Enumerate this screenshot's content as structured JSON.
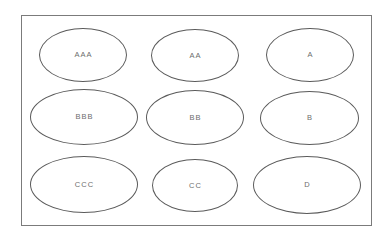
{
  "diagram": {
    "type": "ellipse-grid",
    "frame": {
      "border_color": "#7b7b7b",
      "background": "#ffffff"
    },
    "style": {
      "ellipse_stroke": "#5b5b5b",
      "ellipse_fill": "#ffffff",
      "label_color": "#6e6e6e"
    },
    "rows": [
      {
        "row_index": 1,
        "nodes": [
          {
            "label": "AAA",
            "left": 17,
            "top": 12,
            "width": 88,
            "height": 54
          },
          {
            "label": "AA",
            "left": 129,
            "top": 13,
            "width": 88,
            "height": 53
          },
          {
            "label": "A",
            "left": 244,
            "top": 12,
            "width": 88,
            "height": 54
          }
        ]
      },
      {
        "row_index": 2,
        "nodes": [
          {
            "label": "BBB",
            "left": 8,
            "top": 73,
            "width": 108,
            "height": 56
          },
          {
            "label": "BB",
            "left": 124,
            "top": 74,
            "width": 98,
            "height": 55
          },
          {
            "label": "B",
            "left": 238,
            "top": 75,
            "width": 99,
            "height": 54
          }
        ]
      },
      {
        "row_index": 3,
        "nodes": [
          {
            "label": "CCC",
            "left": 8,
            "top": 140,
            "width": 108,
            "height": 57
          },
          {
            "label": "CC",
            "left": 130,
            "top": 143,
            "width": 86,
            "height": 53
          },
          {
            "label": "D",
            "left": 231,
            "top": 140,
            "width": 108,
            "height": 58
          }
        ]
      }
    ]
  }
}
